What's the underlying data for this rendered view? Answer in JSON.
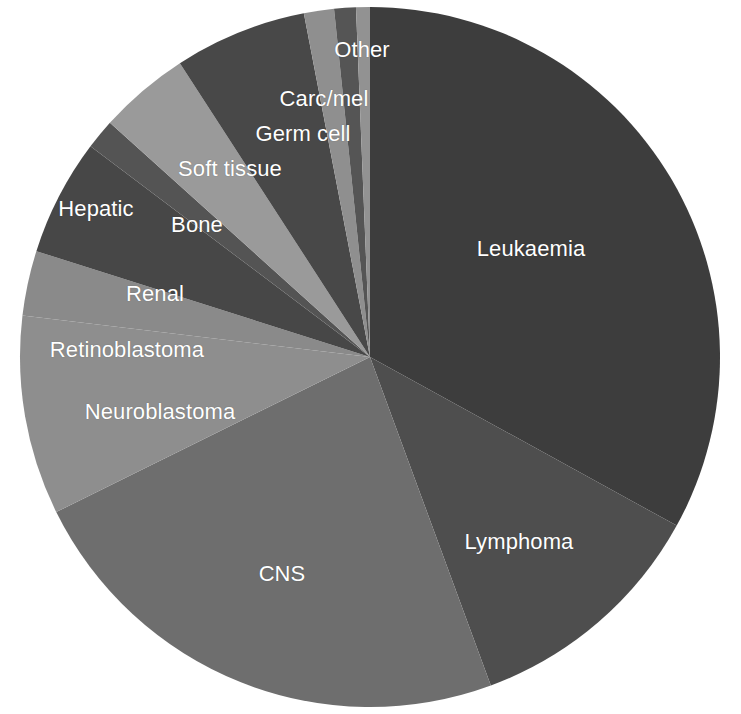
{
  "chart_data": {
    "type": "pie",
    "title": "",
    "subtitle": "",
    "xlabel": "",
    "ylabel": "",
    "legend_position": "none",
    "grid": false,
    "label_color": "#ffffff",
    "background_color": "#ffffff",
    "start_angle_deg": 0,
    "direction": "clockwise",
    "center": {
      "x": 370,
      "y": 357,
      "radius": 350
    },
    "categories": [
      "Leukaemia",
      "Lymphoma",
      "CNS",
      "Neuroblastoma",
      "Retinoblastoma",
      "Renal",
      "Hepatic",
      "Bone",
      "Soft tissue",
      "Germ cell",
      "Carc/mel",
      "Other"
    ],
    "values": [
      33.0,
      11.4,
      23.3,
      9.2,
      3.0,
      5.4,
      1.4,
      4.2,
      6.1,
      1.4,
      1.0,
      0.6
    ],
    "units": "percent",
    "slices": [
      {
        "label": "Leukaemia",
        "value": 33.0,
        "angle_deg": 118.8,
        "color": "#3d3d3d",
        "label_x": 531,
        "label_y": 249
      },
      {
        "label": "Lymphoma",
        "value": 11.4,
        "angle_deg": 41.0,
        "color": "#4e4e4e",
        "label_x": 519,
        "label_y": 542
      },
      {
        "label": "CNS",
        "value": 23.3,
        "angle_deg": 83.9,
        "color": "#6e6e6e",
        "label_x": 282,
        "label_y": 574
      },
      {
        "label": "Neuroblastoma",
        "value": 9.2,
        "angle_deg": 33.1,
        "color": "#8e8e8e",
        "label_x": 160,
        "label_y": 412
      },
      {
        "label": "Retinoblastoma",
        "value": 3.0,
        "angle_deg": 10.8,
        "color": "#8a8a8a",
        "label_x": 127,
        "label_y": 350
      },
      {
        "label": "Renal",
        "value": 5.4,
        "angle_deg": 19.4,
        "color": "#474747",
        "label_x": 155,
        "label_y": 294
      },
      {
        "label": "Hepatic",
        "value": 1.4,
        "angle_deg": 5.0,
        "color": "#545454",
        "label_x": 96,
        "label_y": 209
      },
      {
        "label": "Bone",
        "value": 4.2,
        "angle_deg": 15.1,
        "color": "#9a9a9a",
        "label_x": 197,
        "label_y": 225
      },
      {
        "label": "Soft tissue",
        "value": 6.1,
        "angle_deg": 22.0,
        "color": "#484848",
        "label_x": 230,
        "label_y": 169
      },
      {
        "label": "Germ cell",
        "value": 1.4,
        "angle_deg": 5.0,
        "color": "#8f8f8f",
        "label_x": 303,
        "label_y": 134
      },
      {
        "label": "Carc/mel",
        "value": 1.0,
        "angle_deg": 3.6,
        "color": "#555555",
        "label_x": 324,
        "label_y": 99
      },
      {
        "label": "Other",
        "value": 0.6,
        "angle_deg": 2.3,
        "color": "#929292",
        "label_x": 362,
        "label_y": 50
      }
    ]
  }
}
